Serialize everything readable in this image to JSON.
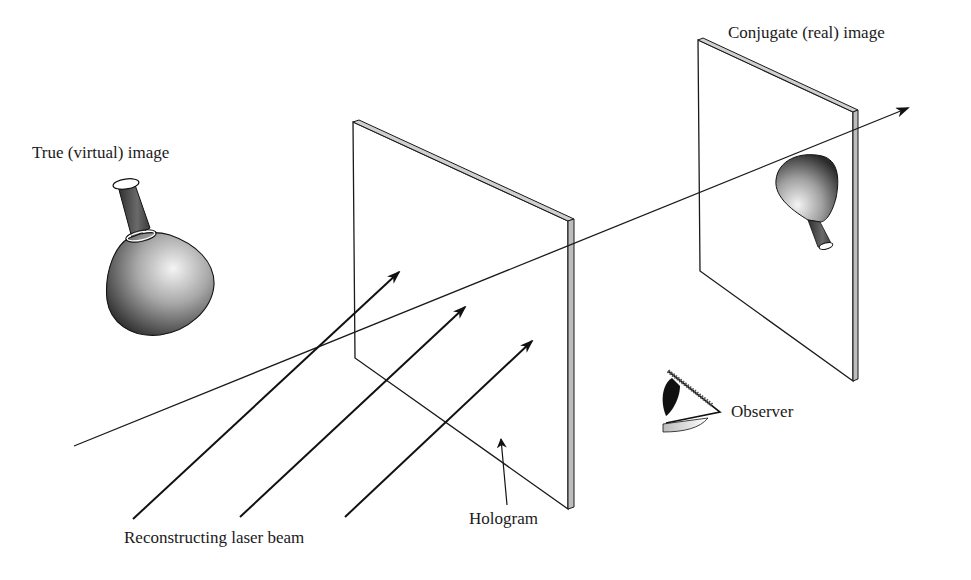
{
  "figure": {
    "type": "holography-reconstruction-diagram",
    "labels": {
      "true_image": "True (virtual) image",
      "conjugate_image": "Conjugate (real) image",
      "observer": "Observer",
      "reconstructing_beam": "Reconstructing laser beam",
      "hologram": "Hologram"
    },
    "elements": [
      {
        "name": "hologram-plate",
        "label": "Hologram"
      },
      {
        "name": "conjugate-image-plane",
        "label": "Conjugate (real) image"
      },
      {
        "name": "virtual-flask",
        "label": "True (virtual) image"
      },
      {
        "name": "real-flask-inverted",
        "label": "Conjugate (real) image"
      },
      {
        "name": "observer-eye",
        "label": "Observer"
      },
      {
        "name": "laser-beam-arrows",
        "count": 3,
        "label": "Reconstructing laser beam"
      },
      {
        "name": "axis-ray-arrow"
      }
    ],
    "colors": {
      "line": "#1a1a1a",
      "plate_edge": "#bdbdbd",
      "background": "#ffffff"
    }
  }
}
